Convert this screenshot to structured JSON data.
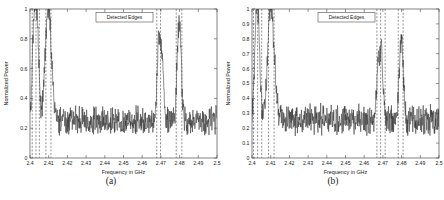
{
  "figure": {
    "panels": [
      {
        "id": "a",
        "caption": "(a)",
        "legend_label": "Detected Edges",
        "chart_data": {
          "type": "line",
          "title": "",
          "xlabel": "Frequency in GHz",
          "ylabel": "Normalized Power",
          "xlim": [
            2.4,
            2.5
          ],
          "ylim": [
            0,
            1
          ],
          "xticks": [
            2.4,
            2.41,
            2.42,
            2.43,
            2.44,
            2.45,
            2.46,
            2.47,
            2.48,
            2.49,
            2.5
          ],
          "xticklabels": [
            "2.4",
            "2.41",
            "2.42",
            "2.43",
            "2.44",
            "2.45",
            "2.46",
            "2.47",
            "2.48",
            "2.49",
            "2.5"
          ],
          "yticks": [
            0,
            0.2,
            0.4,
            0.6,
            0.8,
            1
          ],
          "yticklabels": [
            "0",
            "0.2",
            "0.4",
            "0.6",
            "0.8",
            "1"
          ],
          "grid": false,
          "legend_position": "upper center",
          "series": [
            {
              "name": "Normalized Power Spectrum",
              "style": "solid",
              "color": "#333333",
              "noise_floor": 0.25,
              "noise_amplitude": 0.07,
              "peaks": [
                {
                  "center": 2.4025,
                  "height": 1.0,
                  "width": 0.0011
                },
                {
                  "center": 2.4042,
                  "height": 0.62,
                  "width": 0.0008
                },
                {
                  "center": 2.4098,
                  "height": 1.0,
                  "width": 0.0016
                },
                {
                  "center": 2.4688,
                  "height": 0.74,
                  "width": 0.0009
                },
                {
                  "center": 2.4705,
                  "height": 0.66,
                  "width": 0.0009
                },
                {
                  "center": 2.4792,
                  "height": 0.64,
                  "width": 0.0009
                },
                {
                  "center": 2.4803,
                  "height": 0.67,
                  "width": 0.0009
                }
              ]
            },
            {
              "name": "Detected Edges",
              "style": "dashed",
              "color": "#555555",
              "edges": [
                2.4012,
                2.4032,
                2.405,
                2.4085,
                2.4112,
                2.4678,
                2.4698,
                2.4782,
                2.4812
              ]
            }
          ]
        }
      },
      {
        "id": "b",
        "caption": "(b)",
        "legend_label": "Detected Edges",
        "chart_data": {
          "type": "line",
          "title": "",
          "xlabel": "Frequency in GHz",
          "ylabel": "Normalized Power",
          "xlim": [
            2.4,
            2.5
          ],
          "ylim": [
            0,
            1
          ],
          "xticks": [
            2.4,
            2.41,
            2.42,
            2.43,
            2.44,
            2.45,
            2.46,
            2.47,
            2.48,
            2.49,
            2.5
          ],
          "xticklabels": [
            "2.4",
            "2.41",
            "2.42",
            "2.43",
            "2.44",
            "2.45",
            "2.46",
            "2.47",
            "2.48",
            "2.49",
            "2.5"
          ],
          "yticks": [
            0,
            0.1,
            0.2,
            0.3,
            0.4,
            0.5,
            0.6,
            0.7,
            0.8,
            0.9,
            1
          ],
          "yticklabels": [
            "0",
            "0.1",
            "0.2",
            "0.3",
            "0.4",
            "0.5",
            "0.6",
            "0.7",
            "0.8",
            "0.9",
            "1"
          ],
          "grid": false,
          "legend_position": "upper center",
          "series": [
            {
              "name": "Normalized Power Spectrum",
              "style": "solid",
              "color": "#333333",
              "noise_floor": 0.26,
              "noise_amplitude": 0.075,
              "peaks": [
                {
                  "center": 2.4025,
                  "height": 1.0,
                  "width": 0.001
                },
                {
                  "center": 2.404,
                  "height": 0.5,
                  "width": 0.0008
                },
                {
                  "center": 2.4098,
                  "height": 1.0,
                  "width": 0.0015
                },
                {
                  "center": 2.412,
                  "height": 0.45,
                  "width": 0.0012
                },
                {
                  "center": 2.469,
                  "height": 0.73,
                  "width": 0.0009
                },
                {
                  "center": 2.4672,
                  "height": 0.56,
                  "width": 0.0007
                },
                {
                  "center": 2.4798,
                  "height": 0.82,
                  "width": 0.001
                }
              ]
            },
            {
              "name": "Detected Edges",
              "style": "dashed",
              "color": "#555555",
              "edges": [
                2.4008,
                2.403,
                2.4052,
                2.4088,
                2.4118,
                2.4668,
                2.4688,
                2.4712,
                2.4782,
                2.4808
              ]
            }
          ]
        }
      }
    ]
  },
  "colors": {
    "axis": "#4d4d4d",
    "trace": "#333333",
    "edge": "#555555",
    "text": "#1a1a1a",
    "background": "#ffffff"
  }
}
